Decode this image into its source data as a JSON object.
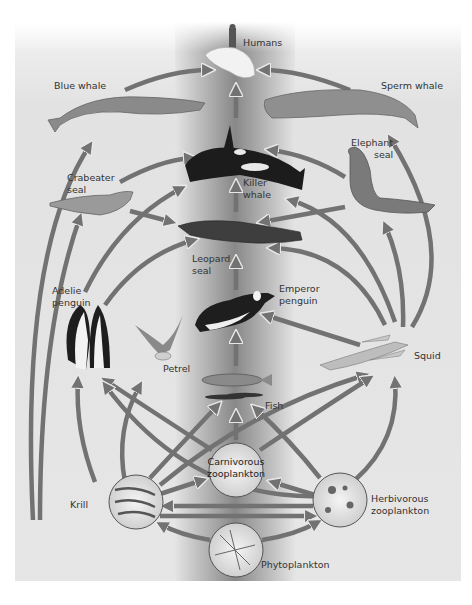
{
  "diagram": {
    "type": "food-web",
    "theme": "Antarctic marine food web",
    "colors": {
      "page_bg": "#ffffff",
      "panel_bg": "#e4e4e4",
      "center_band": "#8c8c8c",
      "arrow_fill": "#727272",
      "arrow_outline": "#d8d8d8",
      "label_text": "#333333"
    },
    "nodes": {
      "humans": {
        "label": "Humans"
      },
      "blue_whale": {
        "label": "Blue whale"
      },
      "sperm_whale": {
        "label": "Sperm whale"
      },
      "killer_whale": {
        "label_1": "Killer",
        "label_2": "whale"
      },
      "elephant_seal": {
        "label_1": "Elephant",
        "label_2": "seal"
      },
      "crabeater_seal": {
        "label_1": "Crabeater",
        "label_2": "seal"
      },
      "leopard_seal": {
        "label_1": "Leopard",
        "label_2": "seal"
      },
      "emperor_penguin": {
        "label_1": "Emperor",
        "label_2": "penguin"
      },
      "adelie_penguin": {
        "label_1": "Adelie",
        "label_2": "penguin"
      },
      "petrel": {
        "label": "Petrel"
      },
      "squid": {
        "label": "Squid"
      },
      "fish": {
        "label": "Fish"
      },
      "carnivorous_zooplankton": {
        "label_1": "Carnivorous",
        "label_2": "zooplankton"
      },
      "krill": {
        "label": "Krill"
      },
      "herbivorous_zooplankton": {
        "label_1": "Herbivorous",
        "label_2": "zooplankton"
      },
      "phytoplankton": {
        "label": "Phytoplankton"
      }
    },
    "edges": [
      [
        "blue_whale",
        "humans"
      ],
      [
        "sperm_whale",
        "humans"
      ],
      [
        "killer_whale",
        "humans"
      ],
      [
        "crabeater_seal",
        "killer_whale"
      ],
      [
        "elephant_seal",
        "killer_whale"
      ],
      [
        "leopard_seal",
        "killer_whale"
      ],
      [
        "adelie_penguin",
        "killer_whale"
      ],
      [
        "squid",
        "killer_whale"
      ],
      [
        "crabeater_seal",
        "leopard_seal"
      ],
      [
        "elephant_seal",
        "leopard_seal"
      ],
      [
        "adelie_penguin",
        "leopard_seal"
      ],
      [
        "emperor_penguin",
        "leopard_seal"
      ],
      [
        "squid",
        "leopard_seal"
      ],
      [
        "squid",
        "elephant_seal"
      ],
      [
        "squid",
        "sperm_whale"
      ],
      [
        "squid",
        "emperor_penguin"
      ],
      [
        "fish",
        "emperor_penguin"
      ],
      [
        "krill",
        "blue_whale"
      ],
      [
        "krill",
        "crabeater_seal"
      ],
      [
        "krill",
        "adelie_penguin"
      ],
      [
        "krill",
        "petrel"
      ],
      [
        "krill",
        "fish"
      ],
      [
        "krill",
        "squid"
      ],
      [
        "krill",
        "carnivorous_zooplankton"
      ],
      [
        "carnivorous_zooplankton",
        "fish"
      ],
      [
        "carnivorous_zooplankton",
        "adelie_penguin"
      ],
      [
        "carnivorous_zooplankton",
        "squid"
      ],
      [
        "herbivorous_zooplankton",
        "fish"
      ],
      [
        "herbivorous_zooplankton",
        "squid"
      ],
      [
        "herbivorous_zooplankton",
        "carnivorous_zooplankton"
      ],
      [
        "herbivorous_zooplankton",
        "krill"
      ],
      [
        "phytoplankton",
        "krill"
      ],
      [
        "phytoplankton",
        "herbivorous_zooplankton"
      ]
    ]
  }
}
